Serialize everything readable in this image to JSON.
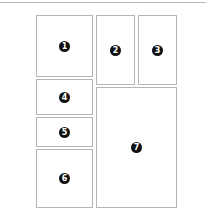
{
  "diagram": {
    "type": "layout-grid",
    "panels": [
      {
        "id": "1",
        "label": "1"
      },
      {
        "id": "2",
        "label": "2"
      },
      {
        "id": "3",
        "label": "3"
      },
      {
        "id": "4",
        "label": "4"
      },
      {
        "id": "5",
        "label": "5"
      },
      {
        "id": "6",
        "label": "6"
      },
      {
        "id": "7",
        "label": "7"
      }
    ],
    "colors": {
      "border": "#b5b5b5",
      "badge": "#111111",
      "badge_text": "#ffffff"
    }
  }
}
